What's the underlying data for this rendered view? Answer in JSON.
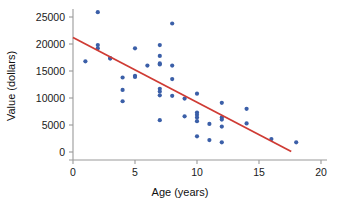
{
  "chart_data": {
    "type": "scatter",
    "title": "",
    "xlabel": "Age (years)",
    "ylabel": "Value (dollars)",
    "xlim": [
      0,
      20
    ],
    "ylim": [
      0,
      26500
    ],
    "xticks": [
      0,
      5,
      10,
      15,
      20
    ],
    "yticks": [
      0,
      5000,
      10000,
      15000,
      20000,
      25000
    ],
    "xtick_labels": [
      "0",
      "5",
      "10",
      "15",
      "20"
    ],
    "ytick_labels": [
      "0",
      "5000",
      "10000",
      "15000",
      "20000",
      "25000"
    ],
    "grid": false,
    "legend": null,
    "point_color": "#3b5fa8",
    "trendline_color": "#cf3b34",
    "axis_color": "#9a9a9a",
    "series": [
      {
        "name": "Used car value vs age",
        "marker": "circle",
        "points": [
          [
            1,
            16800
          ],
          [
            2,
            25900
          ],
          [
            2,
            19800
          ],
          [
            2,
            19200
          ],
          [
            3,
            17400
          ],
          [
            3,
            17300
          ],
          [
            4,
            13800
          ],
          [
            4,
            11500
          ],
          [
            4,
            9400
          ],
          [
            5,
            19200
          ],
          [
            5,
            14100
          ],
          [
            5,
            13900
          ],
          [
            6,
            16000
          ],
          [
            7,
            19800
          ],
          [
            7,
            17800
          ],
          [
            7,
            16400
          ],
          [
            7,
            16200
          ],
          [
            7,
            11700
          ],
          [
            7,
            11200
          ],
          [
            7,
            10500
          ],
          [
            7,
            5900
          ],
          [
            8,
            23800
          ],
          [
            8,
            16000
          ],
          [
            8,
            13500
          ],
          [
            8,
            10400
          ],
          [
            9,
            9900
          ],
          [
            9,
            6600
          ],
          [
            10,
            10800
          ],
          [
            10,
            7300
          ],
          [
            10,
            6900
          ],
          [
            10,
            6400
          ],
          [
            10,
            5700
          ],
          [
            10,
            2900
          ],
          [
            11,
            5200
          ],
          [
            11,
            2200
          ],
          [
            12,
            9100
          ],
          [
            12,
            6400
          ],
          [
            12,
            6000
          ],
          [
            12,
            4700
          ],
          [
            12,
            1800
          ],
          [
            14,
            8000
          ],
          [
            14,
            5300
          ],
          [
            16,
            2400
          ],
          [
            18,
            1800
          ]
        ]
      }
    ],
    "trendline": {
      "type": "line",
      "label": "least-squares regression line",
      "x_start": 0,
      "y_start": 21200,
      "x_end": 17.6,
      "y_end": 100,
      "slope": -1198,
      "intercept": 21200
    }
  }
}
